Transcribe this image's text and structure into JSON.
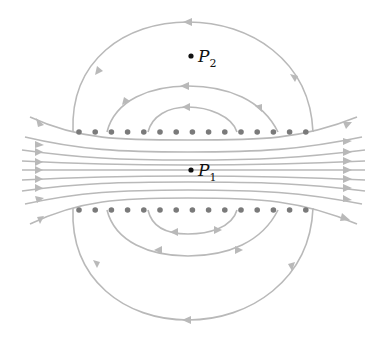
{
  "diagram": {
    "colors": {
      "field_line": "#b9b9b9",
      "wire": "#7a7a7a",
      "point": "#111111"
    },
    "wire_rows": [
      {
        "name": "top-row",
        "y": 132,
        "count": 15,
        "x_start": 79,
        "spacing": 16.2
      },
      {
        "name": "bottom-row",
        "y": 210,
        "count": 15,
        "x_start": 79,
        "spacing": 16.2
      }
    ],
    "points": [
      {
        "name": "P2",
        "letter": "P",
        "subscript": "2",
        "x": 191,
        "y": 56
      },
      {
        "name": "P1",
        "letter": "P",
        "subscript": "1",
        "x": 191,
        "y": 170
      }
    ]
  }
}
